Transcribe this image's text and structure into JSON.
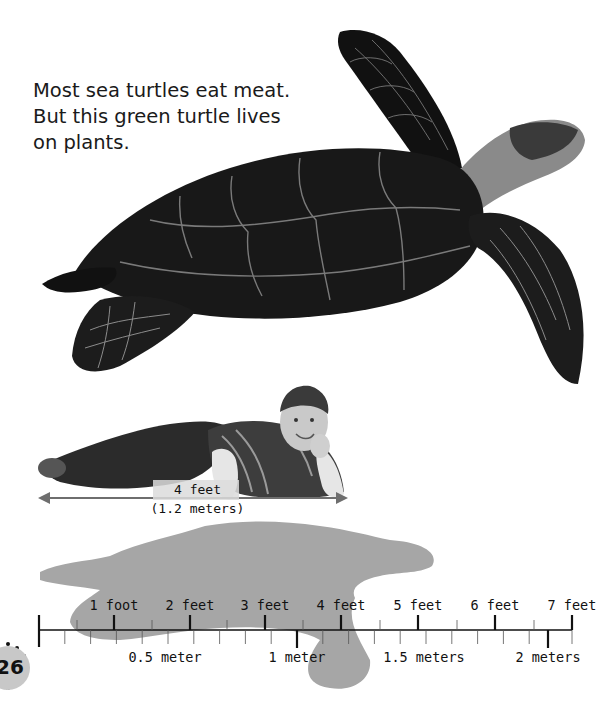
{
  "caption": {
    "lines": [
      "Most sea turtles eat meat.",
      "But this green turtle lives",
      "on plants."
    ]
  },
  "images": {
    "turtle": "green-sea-turtle-photo",
    "boy": "boy-lying-down-photo",
    "silhouette": "turtle-silhouette"
  },
  "comparison": {
    "boy_length_feet": "4 feet",
    "boy_length_meters": "(1.2 meters)"
  },
  "ruler": {
    "feet_labels": [
      "1 foot",
      "2 feet",
      "3 feet",
      "4 feet",
      "5 feet",
      "6 feet",
      "7 feet"
    ],
    "meter_labels": [
      "0.5 meter",
      "1 meter",
      "1.5 meters",
      "2 meters"
    ]
  },
  "page": {
    "number": "26"
  },
  "colors": {
    "silhouette": "#a6a6a6",
    "arrow": "#6e6e6e",
    "ruler": "#111111",
    "badge": "#c8c8c8"
  }
}
